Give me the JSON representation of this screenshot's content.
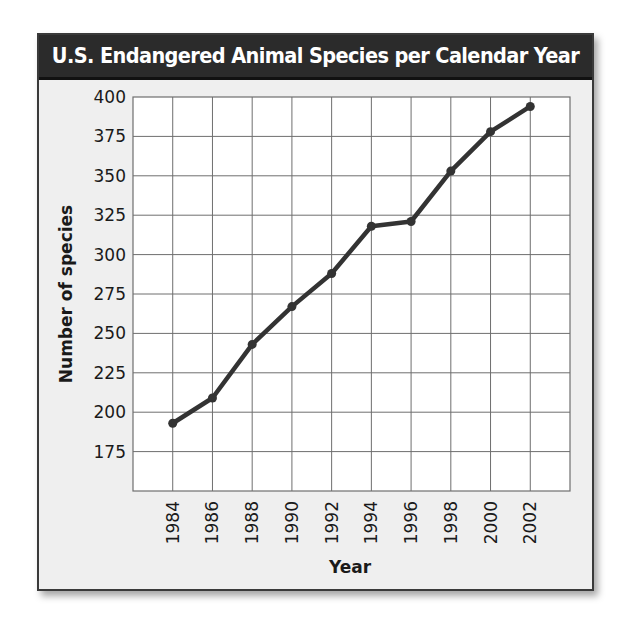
{
  "title": "U.S. Endangered Animal Species per Calendar Year",
  "colors": {
    "title_bg": "#2b2b2b",
    "title_text": "#ffffff",
    "frame_bg": "#efefef",
    "plot_bg": "#ffffff",
    "grid": "#6e6e6e",
    "line": "#333333"
  },
  "chart_data": {
    "type": "line",
    "title": "U.S. Endangered Animal Species per Calendar Year",
    "xlabel": "Year",
    "ylabel": "Number of species",
    "categories": [
      "1984",
      "1986",
      "1988",
      "1990",
      "1992",
      "1994",
      "1996",
      "1998",
      "2000",
      "2002"
    ],
    "series": [
      {
        "name": "Number of species",
        "values": [
          193,
          209,
          243,
          267,
          288,
          318,
          321,
          353,
          378,
          394
        ]
      }
    ],
    "x": [
      1984,
      1986,
      1988,
      1990,
      1992,
      1994,
      1996,
      1998,
      2000,
      2002
    ],
    "y_ticks": [
      "400",
      "375",
      "350",
      "325",
      "300",
      "275",
      "250",
      "225",
      "200",
      "175"
    ],
    "ylim": [
      150,
      400
    ],
    "y_tick_step": 25,
    "xlim": [
      1982,
      2004
    ],
    "grid": true,
    "legend": "none",
    "markers": true
  }
}
